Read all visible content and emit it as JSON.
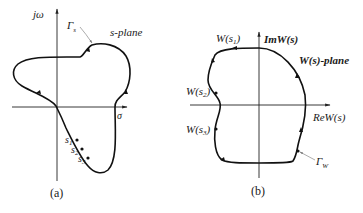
{
  "panel_a": {
    "vertical_axis_label": "jω",
    "horizontal_axis_label": "σ",
    "plane_label": "s-plane",
    "contour_label_base": "Γ",
    "contour_label_sub": "s",
    "points": [
      {
        "base": "s",
        "sub": "1"
      },
      {
        "base": "s",
        "sub": "2"
      },
      {
        "base": "s",
        "sub": "3"
      }
    ],
    "caption": "(a)"
  },
  "panel_b": {
    "vertical_axis_label": "ImW(s)",
    "horizontal_axis_label": "ReW(s)",
    "plane_label": "W(s)-plane",
    "contour_label_base": "Γ",
    "contour_label_sub": "W",
    "points": [
      {
        "label_pre": "W(s",
        "sub": "1",
        "label_post": ")"
      },
      {
        "label_pre": "W(s",
        "sub": "2",
        "label_post": ")"
      },
      {
        "label_pre": "W(s",
        "sub": "3",
        "label_post": ")"
      }
    ],
    "caption": "(b)"
  }
}
